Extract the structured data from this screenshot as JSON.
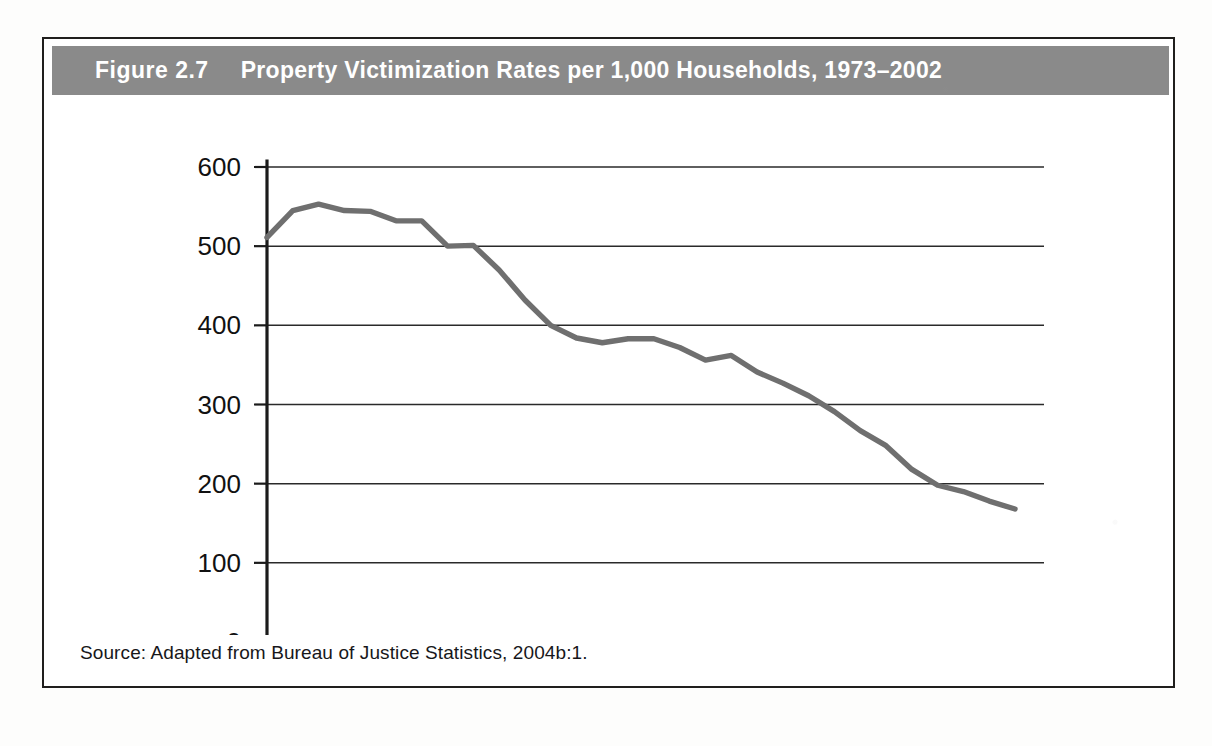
{
  "figure": {
    "number": "Figure 2.7",
    "title": "Property Victimization Rates per 1,000 Households, 1973–2002",
    "source": "Source: Adapted from Bureau of Justice Statistics, 2004b:1.",
    "banner_color": "#8a8a8a",
    "line_color": "#6f6f6f",
    "border_color": "#201f1d"
  },
  "chart_data": {
    "type": "line",
    "title": "Property Victimization Rates per 1,000 Households, 1973–2002",
    "xlabel": "",
    "ylabel": "",
    "xlim": [
      1973,
      2002
    ],
    "ylim": [
      0,
      600
    ],
    "grid": true,
    "legend": false,
    "y_ticks": [
      0,
      100,
      200,
      300,
      400,
      500,
      600
    ],
    "y_tick_labels": [
      "0",
      "100",
      "200",
      "300",
      "400",
      "500",
      "600"
    ],
    "x_ticks": [
      1973,
      1974,
      1975,
      1976,
      1977,
      1978,
      1979,
      1980,
      1981,
      1982,
      1983,
      1984,
      1985,
      1986,
      1987,
      1988,
      1989,
      1990,
      1991,
      1992,
      1993,
      1994,
      1995,
      1996,
      1997,
      1998,
      1999,
      2000,
      2001,
      2002
    ],
    "x_tick_labels": [
      "1973",
      "",
      "",
      "1976",
      "",
      "",
      "1979",
      "",
      "",
      "1982",
      "",
      "",
      "1985",
      "",
      "",
      "1988",
      "",
      "",
      "1991",
      "",
      "",
      "1994",
      "",
      "",
      "1997",
      "",
      "",
      "2000",
      "",
      ""
    ],
    "x_labeled_ticks": [
      1973,
      1976,
      1979,
      1982,
      1985,
      1988,
      1991,
      1994,
      1997,
      2000
    ],
    "x": [
      1973,
      1974,
      1975,
      1976,
      1977,
      1978,
      1979,
      1980,
      1981,
      1982,
      1983,
      1984,
      1985,
      1986,
      1987,
      1988,
      1989,
      1990,
      1991,
      1992,
      1993,
      1994,
      1995,
      1996,
      1997,
      1998,
      1999,
      2000,
      2001,
      2002
    ],
    "values": [
      511,
      545,
      553,
      545,
      544,
      532,
      532,
      500,
      501,
      470,
      432,
      400,
      384,
      378,
      383,
      383,
      372,
      356,
      362,
      341,
      327,
      311,
      291,
      267,
      248,
      218,
      198,
      190,
      178,
      168
    ],
    "series": [
      {
        "name": "Property victimization rate per 1,000 households",
        "values": [
          511,
          545,
          553,
          545,
          544,
          532,
          532,
          500,
          501,
          470,
          432,
          400,
          384,
          378,
          383,
          383,
          372,
          356,
          362,
          341,
          327,
          311,
          291,
          267,
          248,
          218,
          198,
          190,
          178,
          168
        ]
      }
    ]
  }
}
